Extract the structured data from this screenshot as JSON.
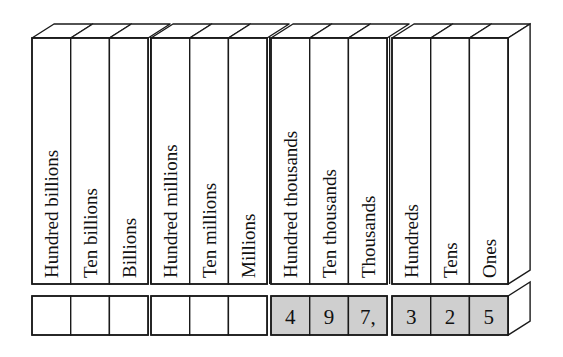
{
  "diagram": {
    "title": "",
    "type": "place-value-chart",
    "colors": {
      "line": "#1a1a1a",
      "face": "#ffffff",
      "filled_box": "#cfcfcf",
      "empty_box": "#ffffff",
      "text": "#111111"
    },
    "periods": [
      {
        "name": "billions",
        "columns": [
          {
            "label": "Hundred billions",
            "digit": ""
          },
          {
            "label": "Ten billions",
            "digit": ""
          },
          {
            "label": "Billions",
            "digit": ""
          }
        ]
      },
      {
        "name": "millions",
        "columns": [
          {
            "label": "Hundred millions",
            "digit": ""
          },
          {
            "label": "Ten millions",
            "digit": ""
          },
          {
            "label": "Millions",
            "digit": ""
          }
        ]
      },
      {
        "name": "thousands",
        "columns": [
          {
            "label": "Hundred thousands",
            "digit": "4"
          },
          {
            "label": "Ten thousands",
            "digit": "9"
          },
          {
            "label": "Thousands",
            "digit": "7,"
          }
        ]
      },
      {
        "name": "ones",
        "columns": [
          {
            "label": "Hundreds",
            "digit": "3"
          },
          {
            "label": "Tens",
            "digit": "2"
          },
          {
            "label": "Ones",
            "digit": "5"
          }
        ]
      }
    ],
    "number_shown": "497,325"
  }
}
